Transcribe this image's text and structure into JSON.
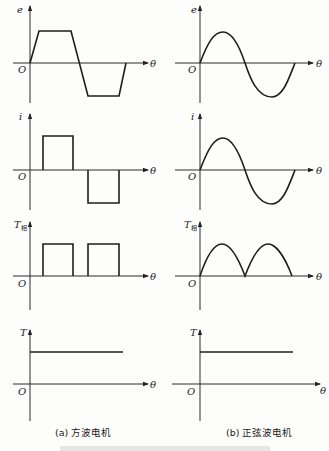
{
  "figure": {
    "columns": [
      {
        "id": "a",
        "caption": "(a) 方波电机",
        "panels": [
          {
            "ylabel": "e",
            "xlabel": "θ",
            "origin": "O",
            "shape": "trapezoid"
          },
          {
            "ylabel": "i",
            "xlabel": "θ",
            "origin": "O",
            "shape": "square-bipolar"
          },
          {
            "ylabel": "T",
            "ylabel_sub": "相",
            "xlabel": "θ",
            "origin": "O",
            "shape": "square-unipolar"
          },
          {
            "ylabel": "T",
            "xlabel": "θ",
            "origin": "O",
            "shape": "constant"
          }
        ]
      },
      {
        "id": "b",
        "caption": "(b) 正弦波电机",
        "panels": [
          {
            "ylabel": "e",
            "xlabel": "θ",
            "origin": "O",
            "shape": "sine"
          },
          {
            "ylabel": "i",
            "xlabel": "θ",
            "origin": "O",
            "shape": "sine"
          },
          {
            "ylabel": "T",
            "ylabel_sub": "相",
            "xlabel": "θ",
            "origin": "O",
            "shape": "sine-squared"
          },
          {
            "ylabel": "T",
            "xlabel": "θ",
            "origin": "O",
            "shape": "constant"
          }
        ]
      }
    ]
  }
}
